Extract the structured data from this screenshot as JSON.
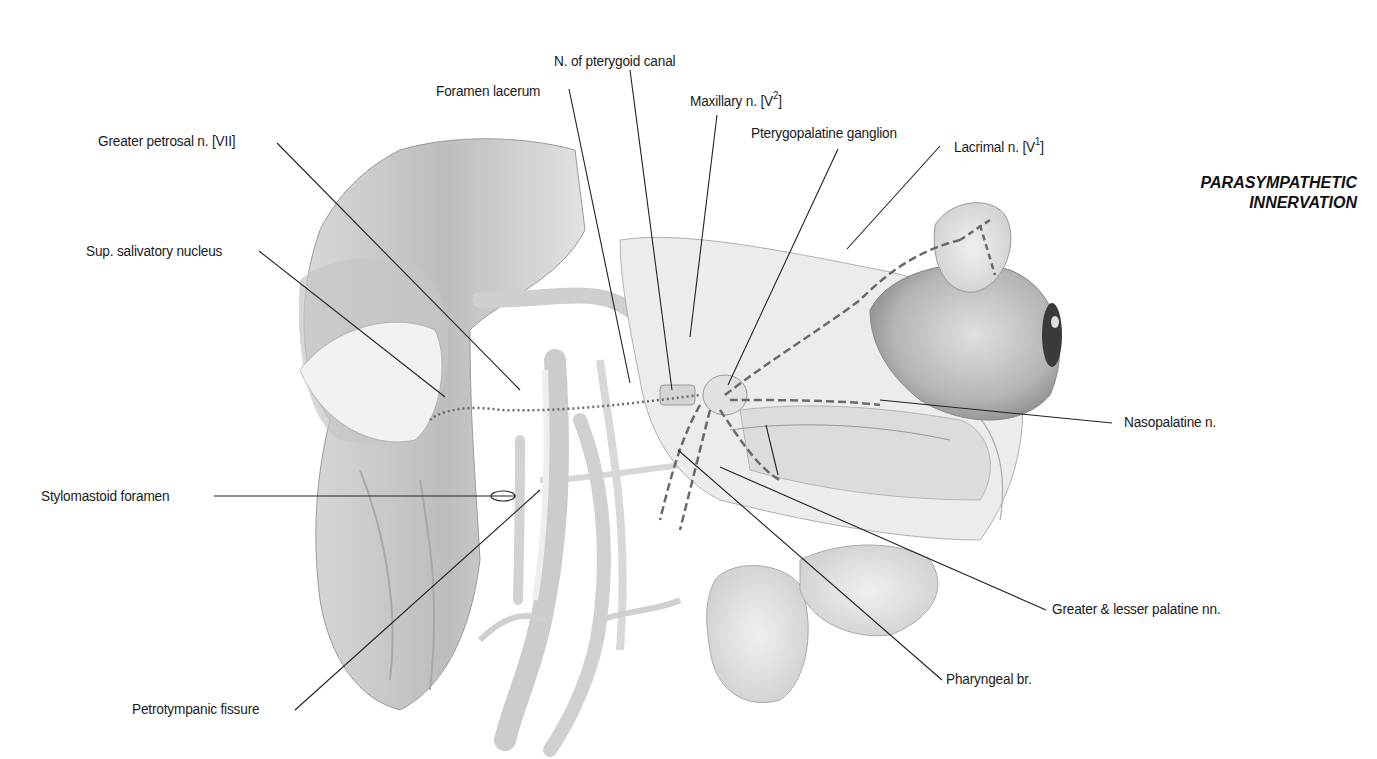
{
  "title": {
    "line1": "PARASYMPATHETIC",
    "line2": "INNERVATION"
  },
  "labels": {
    "n_pterygoid_canal": "N. of pterygoid canal",
    "foramen_lacerum": "Foramen lacerum",
    "maxillary_n": "Maxillary n. [V",
    "maxillary_sup": "2",
    "maxillary_close": "]",
    "pterygopalatine_ganglion": "Pterygopalatine ganglion",
    "lacrimal_n": "Lacrimal n. [V",
    "lacrimal_sup": "1",
    "lacrimal_close": "]",
    "greater_petrosal_n": "Greater petrosal n. [VII]",
    "sup_salivatory_nucleus": "Sup. salivatory nucleus",
    "nasopalatine_n": "Nasopalatine n.",
    "stylomastoid_foramen": "Stylomastoid foramen",
    "greater_lesser_palatine": "Greater & lesser palatine nn.",
    "pharyngeal_br": "Pharyngeal br.",
    "petrotympanic_fissure": "Petrotympanic fissure"
  },
  "colors": {
    "text": "#1a1a1a",
    "leader_line": "#222222",
    "tissue_light": "#e6e6e6",
    "tissue_mid": "#c8c8c8",
    "tissue_dark": "#9a9a9a",
    "nerve_dashed": "#666666"
  }
}
